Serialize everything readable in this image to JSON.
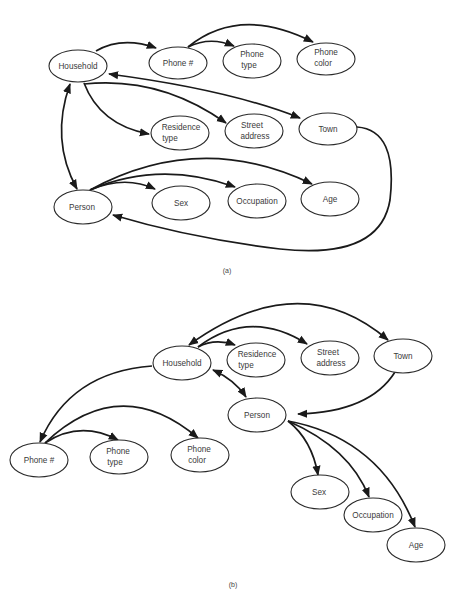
{
  "panels": [
    {
      "id": "a",
      "caption": "(a)",
      "nodes": [
        {
          "id": "household",
          "lines": [
            "Household"
          ]
        },
        {
          "id": "phone_num",
          "lines": [
            "Phone #"
          ]
        },
        {
          "id": "phone_type",
          "lines": [
            "Phone",
            "type"
          ]
        },
        {
          "id": "phone_color",
          "lines": [
            "Phone",
            "color"
          ]
        },
        {
          "id": "residence_type",
          "lines": [
            "Residence",
            "type"
          ]
        },
        {
          "id": "street_address",
          "lines": [
            "Street",
            "address"
          ]
        },
        {
          "id": "town",
          "lines": [
            "Town"
          ]
        },
        {
          "id": "person",
          "lines": [
            "Person"
          ]
        },
        {
          "id": "sex",
          "lines": [
            "Sex"
          ]
        },
        {
          "id": "occupation",
          "lines": [
            "Occupation"
          ]
        },
        {
          "id": "age",
          "lines": [
            "Age"
          ]
        }
      ],
      "edges": [
        {
          "from": "Household",
          "to": "Phone #"
        },
        {
          "from": "Phone #",
          "to": "Phone type"
        },
        {
          "from": "Phone #",
          "to": "Phone color"
        },
        {
          "from": "Household",
          "to": "Residence type"
        },
        {
          "from": "Household",
          "to": "Street address"
        },
        {
          "from": "Town",
          "to": "Household",
          "bidirectional": true
        },
        {
          "from": "Household",
          "to": "Person",
          "bidirectional": true
        },
        {
          "from": "Person",
          "to": "Sex"
        },
        {
          "from": "Person",
          "to": "Occupation"
        },
        {
          "from": "Person",
          "to": "Age"
        },
        {
          "from": "Town",
          "to": "Person"
        }
      ]
    },
    {
      "id": "b",
      "caption": "(b)",
      "nodes": [
        {
          "id": "household",
          "lines": [
            "Household"
          ]
        },
        {
          "id": "residence_type",
          "lines": [
            "Residence",
            "type"
          ]
        },
        {
          "id": "street_address",
          "lines": [
            "Street",
            "address"
          ]
        },
        {
          "id": "town",
          "lines": [
            "Town"
          ]
        },
        {
          "id": "person",
          "lines": [
            "Person"
          ]
        },
        {
          "id": "phone_num",
          "lines": [
            "Phone #"
          ]
        },
        {
          "id": "phone_type",
          "lines": [
            "Phone",
            "type"
          ]
        },
        {
          "id": "phone_color",
          "lines": [
            "Phone",
            "color"
          ]
        },
        {
          "id": "sex",
          "lines": [
            "Sex"
          ]
        },
        {
          "id": "occupation",
          "lines": [
            "Occupation"
          ]
        },
        {
          "id": "age",
          "lines": [
            "Age"
          ]
        }
      ],
      "edges": [
        {
          "from": "Household",
          "to": "Residence type"
        },
        {
          "from": "Household",
          "to": "Street address"
        },
        {
          "from": "Town",
          "to": "Household",
          "bidirectional": true
        },
        {
          "from": "Household",
          "to": "Person",
          "bidirectional": true
        },
        {
          "from": "Town",
          "to": "Person"
        },
        {
          "from": "Household",
          "to": "Phone #"
        },
        {
          "from": "Phone #",
          "to": "Phone type"
        },
        {
          "from": "Phone #",
          "to": "Phone color"
        },
        {
          "from": "Person",
          "to": "Sex"
        },
        {
          "from": "Person",
          "to": "Occupation"
        },
        {
          "from": "Person",
          "to": "Age"
        }
      ]
    }
  ]
}
